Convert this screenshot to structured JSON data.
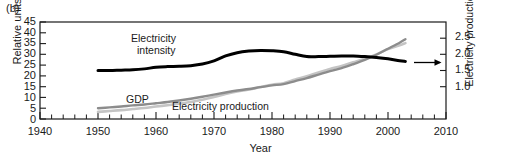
{
  "figure": {
    "panel_label": "(b)",
    "xlabel": "Year"
  },
  "axes": {
    "left": {
      "title": "Relative units",
      "ticks": [
        "0",
        "5",
        "10",
        "15",
        "20",
        "25",
        "30",
        "35",
        "40",
        "45"
      ],
      "min": 0,
      "max": 45
    },
    "right": {
      "title": "Electricity production/GDP",
      "ticks": [
        "1.0",
        "1.5",
        "2.0",
        "2.5"
      ],
      "min": 0.0,
      "max": 3.0
    },
    "bottom": {
      "ticks": [
        "1940",
        "1950",
        "1960",
        "1970",
        "1980",
        "1990",
        "2000",
        "2010"
      ],
      "min": 1940,
      "max": 2010,
      "minor_step": 2
    }
  },
  "annotations": {
    "electricity_intensity": "Electricity\nintensity",
    "electricity_intensity_line1": "Electricity",
    "electricity_intensity_line2": "intensity",
    "gdp": "GDP",
    "electricity_production": "Electricity production",
    "arrow": "right-arrow-to-right-axis"
  },
  "colors": {
    "electricity_intensity": "#000000",
    "gdp": "#8c8c8c",
    "electricity_production": "#c4c4c4",
    "axis": "#1a1a1a"
  },
  "chart_data": {
    "type": "line",
    "title": "",
    "xlabel": "Year",
    "ylabel": "Relative units",
    "y2label": "Electricity production/GDP",
    "xlim": [
      1940,
      2010
    ],
    "ylim": [
      0,
      45
    ],
    "y2lim": [
      0.0,
      3.0
    ],
    "grid": false,
    "legend": "inline-annotations",
    "series": [
      {
        "name": "Electricity intensity",
        "axis": "right",
        "color": "#000000",
        "x": [
          1950,
          1952,
          1954,
          1956,
          1958,
          1960,
          1962,
          1964,
          1966,
          1968,
          1970,
          1972,
          1974,
          1976,
          1978,
          1980,
          1982,
          1984,
          1986,
          1988,
          1990,
          1992,
          1994,
          1996,
          1998,
          2000,
          2002,
          2003
        ],
        "y": [
          1.5,
          1.5,
          1.51,
          1.52,
          1.55,
          1.6,
          1.62,
          1.63,
          1.65,
          1.7,
          1.8,
          1.95,
          2.05,
          2.1,
          2.12,
          2.11,
          2.08,
          2.0,
          1.93,
          1.93,
          1.94,
          1.95,
          1.95,
          1.93,
          1.9,
          1.86,
          1.8,
          1.78
        ]
      },
      {
        "name": "GDP",
        "axis": "left",
        "color": "#8c8c8c",
        "x": [
          1950,
          1952,
          1954,
          1956,
          1958,
          1960,
          1962,
          1964,
          1966,
          1968,
          1970,
          1972,
          1974,
          1976,
          1978,
          1980,
          1982,
          1984,
          1986,
          1988,
          1990,
          1992,
          1994,
          1996,
          1998,
          2000,
          2002,
          2003
        ],
        "y": [
          5.0,
          5.4,
          5.8,
          6.3,
          6.7,
          7.3,
          7.9,
          8.6,
          9.4,
          10.3,
          11.3,
          12.3,
          13.2,
          13.9,
          14.8,
          15.6,
          16.2,
          17.6,
          19.0,
          20.6,
          22.2,
          23.6,
          25.4,
          27.4,
          29.8,
          32.6,
          35.4,
          37.0
        ]
      },
      {
        "name": "Electricity production",
        "axis": "left",
        "color": "#c4c4c4",
        "x": [
          1950,
          1952,
          1954,
          1956,
          1958,
          1960,
          1962,
          1964,
          1966,
          1968,
          1970,
          1972,
          1974,
          1976,
          1978,
          1980,
          1982,
          1984,
          1986,
          1988,
          1990,
          1992,
          1994,
          1996,
          1998,
          2000,
          2002,
          2003
        ],
        "y": [
          3.3,
          3.7,
          4.1,
          4.6,
          5.1,
          5.8,
          6.4,
          7.1,
          7.9,
          8.9,
          10.2,
          11.6,
          12.8,
          13.7,
          14.8,
          15.9,
          16.6,
          18.3,
          19.8,
          21.6,
          23.2,
          24.6,
          26.3,
          28.0,
          30.0,
          32.4,
          34.2,
          35.2
        ]
      }
    ]
  }
}
